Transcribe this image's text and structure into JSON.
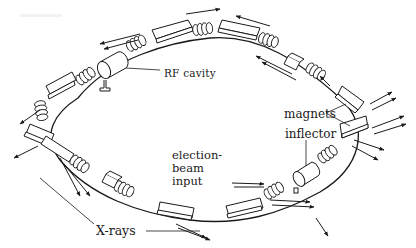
{
  "figure": {
    "style": "black line drawing on white",
    "colors": {
      "ink": "#1a1a1a",
      "background": "#ffffff"
    }
  },
  "labels": {
    "rf_cavity": "RF cavity",
    "magnets": "magnets",
    "inflector": "inflector",
    "beam_input": "election-beam input",
    "xrays": "X-rays"
  },
  "components": [
    {
      "name": "bending-magnet",
      "count": 8
    },
    {
      "name": "rf-cavity",
      "count": 1
    },
    {
      "name": "inflector",
      "count": 1
    },
    {
      "name": "focusing-quadrupole-stack",
      "count": 12
    },
    {
      "name": "straight-section-box",
      "count": 3
    },
    {
      "name": "xray-emission-arrows",
      "count": 16
    }
  ]
}
